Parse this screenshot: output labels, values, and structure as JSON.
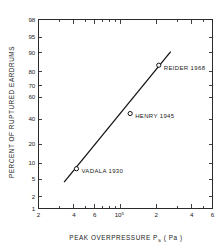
{
  "chart_data": {
    "type": "scatter",
    "title": "",
    "xlabel": "PEAK OVERPRESSURE P_S ( Pa )",
    "xlabel_parts": {
      "main": "PEAK OVERPRESSURE",
      "symbol": "P",
      "subscript": "S",
      "units": "( Pa )"
    },
    "ylabel": "PERCENT OF RUPTURED EARDRUMS",
    "x_scale": "log",
    "y_scale": "probability",
    "xlim": [
      20000,
      600000
    ],
    "ylim": [
      1,
      98
    ],
    "grid": false,
    "legend": "none",
    "x_ticks": [
      {
        "value": 20000,
        "label": "2"
      },
      {
        "value": 40000,
        "label": "4"
      },
      {
        "value": 60000,
        "label": "6"
      },
      {
        "value": 100000,
        "label": "10",
        "superscript": "5"
      },
      {
        "value": 200000,
        "label": "2"
      },
      {
        "value": 400000,
        "label": "4"
      },
      {
        "value": 600000,
        "label": "6"
      }
    ],
    "x_minor_ticks": [
      30000,
      50000,
      70000,
      80000,
      90000,
      300000,
      500000
    ],
    "y_ticks": [
      {
        "value": 1,
        "label": "1"
      },
      {
        "value": 2,
        "label": "2"
      },
      {
        "value": 5,
        "label": "5"
      },
      {
        "value": 10,
        "label": "10"
      },
      {
        "value": 20,
        "label": "20"
      },
      {
        "value": 40,
        "label": "40"
      },
      {
        "value": 60,
        "label": "60"
      },
      {
        "value": 70,
        "label": "70"
      },
      {
        "value": 80,
        "label": "80"
      },
      {
        "value": 90,
        "label": "90"
      },
      {
        "value": 95,
        "label": "95"
      },
      {
        "value": 98,
        "label": "98"
      }
    ],
    "points": [
      {
        "label": "VADALA 1930",
        "x": 42000,
        "y": 8
      },
      {
        "label": "HENRY 1945",
        "x": 120000,
        "y": 45
      },
      {
        "label": "REIDER 1968",
        "x": 210000,
        "y": 84
      }
    ],
    "fit_line": {
      "x_start": 33000,
      "y_start": 4.3,
      "x_end": 265000,
      "y_end": 90.5
    },
    "colors": {
      "axis": "#2b2b2b",
      "line": "#111111",
      "marker_fill": "#ffffff",
      "text": "#1a1a1a",
      "background": "#ffffff"
    }
  }
}
